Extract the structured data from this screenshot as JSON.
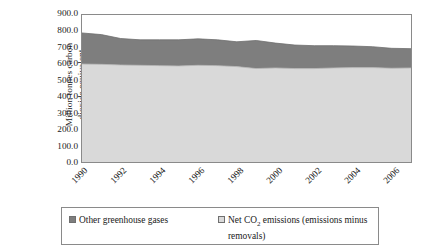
{
  "chart_data": {
    "type": "area",
    "stacked": true,
    "title": "",
    "subtitle": "",
    "xlabel": "",
    "ylabel": "Million tonnes carbon\ndioxide equivalent",
    "ylabel_line1": "Million tonnes carbon",
    "ylabel_line2": "dioxide equivalent",
    "ylim": [
      0,
      900
    ],
    "ytick_values": [
      900.0,
      800.0,
      700.0,
      600.0,
      500.0,
      400.0,
      300.0,
      200.0,
      100.0,
      0.0
    ],
    "ytick_labels": [
      "900.0",
      "800.0",
      "700.0",
      "600.0",
      "500.0",
      "400.0",
      "300.0",
      "200.0",
      "100.0",
      "0.0"
    ],
    "grid": false,
    "legend_position": "bottom",
    "x": [
      1990,
      1991,
      1992,
      1993,
      1994,
      1995,
      1996,
      1997,
      1998,
      1999,
      2000,
      2001,
      2002,
      2003,
      2004,
      2005,
      2006,
      2007
    ],
    "xtick_labels": [
      "1990",
      "1992",
      "1994",
      "1996",
      "1998",
      "2000",
      "2002",
      "2004",
      "2006"
    ],
    "xtick_values": [
      1990,
      1992,
      1994,
      1996,
      1998,
      2000,
      2002,
      2004,
      2006
    ],
    "xlim": [
      1990,
      2007
    ],
    "series": [
      {
        "name": "Net CO2 emissions (emissions minus removals)",
        "color": "#d9d9d9",
        "order": 0,
        "values": [
          600,
          598,
          594,
          592,
          590,
          588,
          592,
          590,
          584,
          572,
          576,
          572,
          572,
          576,
          578,
          578,
          574,
          576
        ]
      },
      {
        "name": "Other greenhouse gases",
        "color": "#7e7e7e",
        "order": 1,
        "values": [
          190,
          182,
          162,
          156,
          158,
          160,
          162,
          158,
          152,
          172,
          152,
          144,
          140,
          136,
          132,
          128,
          122,
          118
        ]
      }
    ],
    "totals": [
      790,
      780,
      756,
      748,
      748,
      748,
      754,
      748,
      736,
      744,
      728,
      716,
      712,
      712,
      710,
      706,
      696,
      694
    ]
  },
  "legend": {
    "entries": [
      {
        "label": "Other greenhouse gases",
        "color": "#7e7e7e",
        "swatch_name": "legend-swatch-other-ghg"
      },
      {
        "label_pre": "Net CO",
        "label_sub": "2",
        "label_post": " emissions (emissions minus removals)",
        "color": "#d9d9d9",
        "swatch_name": "legend-swatch-net-co2"
      }
    ]
  }
}
